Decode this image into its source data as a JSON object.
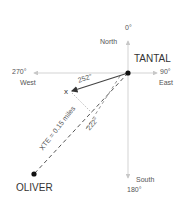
{
  "compass": {
    "north_deg": "0°",
    "north": "North",
    "east_deg": "90°",
    "east": "East",
    "south_deg": "180°",
    "south": "South",
    "west_deg": "270°",
    "west": "West"
  },
  "waypoints": {
    "from": "TANTAL",
    "to": "OLIVER",
    "position_marker": "x"
  },
  "bearings": {
    "actual": "252°",
    "course": "222°"
  },
  "xte_label": "XTE = 0.15 miles",
  "colors": {
    "axis": "#c8c8c8",
    "track": "#555555",
    "text": "#444444",
    "dot": "#111111"
  }
}
